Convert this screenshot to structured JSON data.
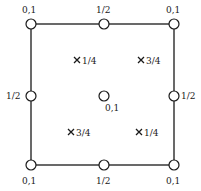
{
  "diagram": {
    "frame": {
      "x1": 31,
      "y1": 24,
      "x2": 174,
      "y2": 165,
      "stroke": "#1a1a1a"
    },
    "circles": [
      {
        "id": "corner-tl",
        "cx": 31,
        "cy": 24,
        "label": "0,1",
        "lx": 22,
        "ly": 13
      },
      {
        "id": "corner-tr",
        "cx": 174,
        "cy": 24,
        "label": "0,1",
        "lx": 166,
        "ly": 13
      },
      {
        "id": "corner-bl",
        "cx": 31,
        "cy": 165,
        "label": "0,1",
        "lx": 22,
        "ly": 184
      },
      {
        "id": "corner-br",
        "cx": 174,
        "cy": 165,
        "label": "0,1",
        "lx": 166,
        "ly": 184
      },
      {
        "id": "mid-top",
        "cx": 104,
        "cy": 24,
        "label": "1/2",
        "lx": 96,
        "ly": 13
      },
      {
        "id": "mid-bottom",
        "cx": 104,
        "cy": 165,
        "label": "1/2",
        "lx": 96,
        "ly": 184
      },
      {
        "id": "mid-left",
        "cx": 31,
        "cy": 96,
        "label": "1/2",
        "lx": 6,
        "ly": 99
      },
      {
        "id": "mid-right",
        "cx": 174,
        "cy": 96,
        "label": "1/2",
        "lx": 181,
        "ly": 99
      },
      {
        "id": "center",
        "cx": 104,
        "cy": 96,
        "label": "0,1",
        "lx": 105,
        "ly": 111
      }
    ],
    "crosses": [
      {
        "id": "cross-tl",
        "x": 77,
        "y": 60,
        "label": "1/4"
      },
      {
        "id": "cross-tr",
        "x": 141,
        "y": 60,
        "label": "3/4"
      },
      {
        "id": "cross-bl",
        "x": 71,
        "y": 132,
        "label": "3/4"
      },
      {
        "id": "cross-br",
        "x": 139,
        "y": 132,
        "label": "1/4"
      }
    ]
  }
}
